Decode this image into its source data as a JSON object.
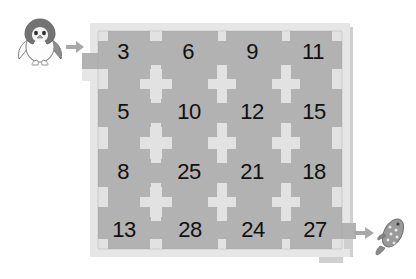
{
  "page": {
    "background_color": "#ffffff"
  },
  "colors": {
    "cell_fill": "#b2b2b2",
    "wall_fill": "#e2e2e2",
    "frame_fill": "#e6e6e6",
    "board_shadow": "#cfcfcf",
    "number_text": "#111111",
    "arrow_color": "#a8a8a8",
    "penguin_body": "#6e6e6e",
    "penguin_belly": "#fdfdfd",
    "fish_body": "#8c8c8c"
  },
  "start_marker": {
    "icon": "penguin-icon",
    "label": "Penguin",
    "arrow_icon": "arrow-right-icon",
    "arrow_direction": "right"
  },
  "end_marker": {
    "icon": "fish-icon",
    "label": "Fish",
    "arrow_icon": "arrow-right-icon",
    "arrow_direction": "right"
  },
  "maze": {
    "rows": 4,
    "columns": 4,
    "entrance": {
      "side": "left",
      "row": 1,
      "cell_value": "3"
    },
    "exit": {
      "side": "right",
      "row": 4,
      "cell_value": "27"
    },
    "grid": [
      [
        "3",
        "6",
        "9",
        "11"
      ],
      [
        "5",
        "10",
        "12",
        "15"
      ],
      [
        "8",
        "25",
        "21",
        "18"
      ],
      [
        "13",
        "28",
        "24",
        "27"
      ]
    ],
    "cells": [
      {
        "value": "3",
        "row": 1,
        "col": 1,
        "x": 41,
        "y": 35
      },
      {
        "value": "6",
        "row": 1,
        "col": 2,
        "x": 106,
        "y": 35
      },
      {
        "value": "9",
        "row": 1,
        "col": 3,
        "x": 170,
        "y": 35
      },
      {
        "value": "11",
        "row": 1,
        "col": 4,
        "x": 231,
        "y": 35
      },
      {
        "value": "5",
        "row": 2,
        "col": 1,
        "x": 41,
        "y": 95
      },
      {
        "value": "10",
        "row": 2,
        "col": 2,
        "x": 107,
        "y": 95
      },
      {
        "value": "12",
        "row": 2,
        "col": 3,
        "x": 170,
        "y": 95
      },
      {
        "value": "15",
        "row": 2,
        "col": 4,
        "x": 232,
        "y": 95
      },
      {
        "value": "8",
        "row": 3,
        "col": 1,
        "x": 41,
        "y": 155
      },
      {
        "value": "25",
        "row": 3,
        "col": 2,
        "x": 107,
        "y": 155
      },
      {
        "value": "21",
        "row": 3,
        "col": 3,
        "x": 170,
        "y": 155
      },
      {
        "value": "18",
        "row": 3,
        "col": 4,
        "x": 232,
        "y": 155
      },
      {
        "value": "13",
        "row": 4,
        "col": 1,
        "x": 42,
        "y": 213
      },
      {
        "value": "28",
        "row": 4,
        "col": 2,
        "x": 108,
        "y": 213
      },
      {
        "value": "24",
        "row": 4,
        "col": 3,
        "x": 171,
        "y": 213
      },
      {
        "value": "27",
        "row": 4,
        "col": 4,
        "x": 233,
        "y": 213
      }
    ]
  }
}
